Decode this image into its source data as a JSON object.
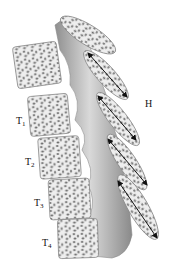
{
  "figure": {
    "labels": {
      "t1": {
        "base": "T",
        "sub": "1"
      },
      "t2": {
        "base": "T",
        "sub": "2"
      },
      "t3": {
        "base": "T",
        "sub": "3"
      },
      "t4": {
        "base": "T",
        "sub": "4"
      },
      "h": "H"
    },
    "colors": {
      "bone_fill": "#ececec",
      "bone_outline": "#8a8a8a",
      "trabecular": "#7a7a7a",
      "pedicle": "#a9a9a9",
      "arrow": "#111111"
    }
  }
}
